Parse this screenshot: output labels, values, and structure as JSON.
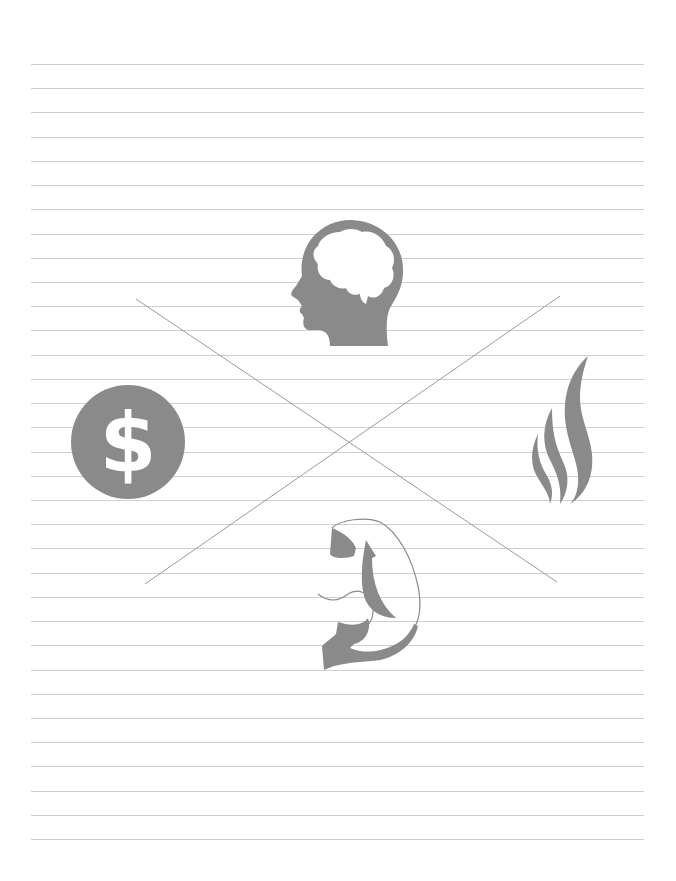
{
  "page": {
    "background": "#ffffff",
    "ruled_lines": {
      "count": 33,
      "first_y": 64,
      "spacing": 24.22,
      "x_start": 31,
      "x_end": 644,
      "color": "#cfcfcf"
    }
  },
  "diagram": {
    "icon_color": "#8a8a8a",
    "cross_color": "#9a9a9a",
    "cross_lines": [
      {
        "from": [
          136,
          299
        ],
        "to": [
          557,
          582
        ]
      },
      {
        "from": [
          560,
          296
        ],
        "to": [
          145,
          584
        ]
      }
    ],
    "icons": [
      {
        "name": "brain-head",
        "position": "top"
      },
      {
        "name": "dollar",
        "position": "left",
        "glyph": "$"
      },
      {
        "name": "flame",
        "position": "right"
      },
      {
        "name": "flexed-arm",
        "position": "bottom"
      }
    ]
  }
}
